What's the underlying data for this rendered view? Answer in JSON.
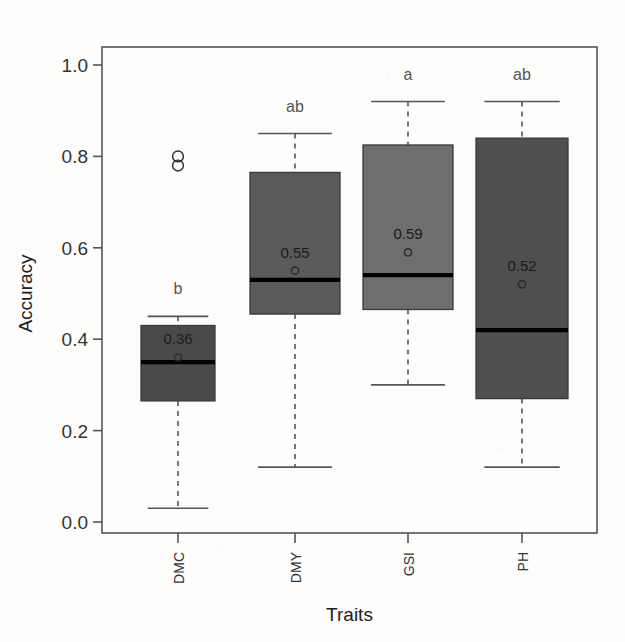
{
  "chart_data": {
    "type": "box",
    "title": "",
    "xlabel": "Traits",
    "ylabel": "Accuracy",
    "categories": [
      "DMC",
      "DMY",
      "GSI",
      "PH"
    ],
    "ylim": [
      0.0,
      1.05
    ],
    "yticks": [
      "0.0",
      "0.2",
      "0.4",
      "0.6",
      "0.8",
      "1.0"
    ],
    "ytick_values": [
      0.0,
      0.2,
      0.4,
      0.6,
      0.8,
      1.0
    ],
    "grid": false,
    "legend": "none",
    "boxes": [
      {
        "category": "DMC",
        "q1": 0.265,
        "median": 0.35,
        "q3": 0.43,
        "whisker_low": 0.03,
        "whisker_high": 0.45,
        "mean": 0.36,
        "mean_label": "0.36",
        "group_label": "b",
        "outliers": [
          0.8,
          0.78
        ],
        "fill": "#4a4a4a"
      },
      {
        "category": "DMY",
        "q1": 0.455,
        "median": 0.53,
        "q3": 0.765,
        "whisker_low": 0.12,
        "whisker_high": 0.85,
        "mean": 0.55,
        "mean_label": "0.55",
        "group_label": "ab",
        "outliers": [],
        "fill": "#5a5a5a"
      },
      {
        "category": "GSI",
        "q1": 0.465,
        "median": 0.54,
        "q3": 0.825,
        "whisker_low": 0.3,
        "whisker_high": 0.92,
        "mean": 0.59,
        "mean_label": "0.59",
        "group_label": "a",
        "outliers": [],
        "fill": "#6e6e6e"
      },
      {
        "category": "PH",
        "q1": 0.27,
        "median": 0.42,
        "q3": 0.84,
        "whisker_low": 0.12,
        "whisker_high": 0.92,
        "mean": 0.52,
        "mean_label": "0.52",
        "group_label": "ab",
        "outliers": [],
        "fill": "#4f4f4f"
      }
    ],
    "colors": {
      "axis": "#555555",
      "median": "#000000",
      "text": "#333333",
      "group_label": "#555555",
      "background": "#fdfdfc"
    }
  }
}
